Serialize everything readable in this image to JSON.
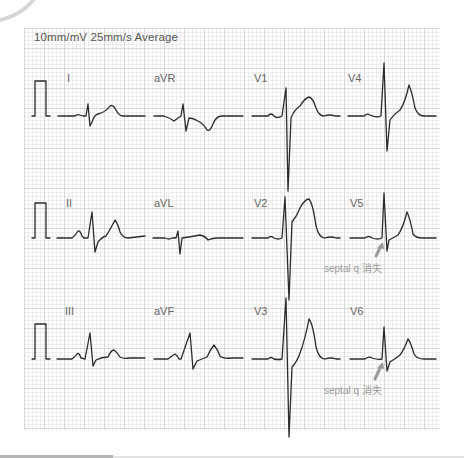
{
  "header": {
    "settings": "10mm/mV 25mm/s Average"
  },
  "leads": [
    {
      "id": "I",
      "label": "I"
    },
    {
      "id": "aVR",
      "label": "aVR"
    },
    {
      "id": "V1",
      "label": "V1"
    },
    {
      "id": "V4",
      "label": "V4"
    },
    {
      "id": "II",
      "label": "II"
    },
    {
      "id": "aVL",
      "label": "aVL"
    },
    {
      "id": "V2",
      "label": "V2"
    },
    {
      "id": "V5",
      "label": "V5"
    },
    {
      "id": "III",
      "label": "III"
    },
    {
      "id": "aVF",
      "label": "aVF"
    },
    {
      "id": "V3",
      "label": "V3"
    },
    {
      "id": "V6",
      "label": "V6"
    }
  ],
  "annotations": [
    {
      "lead": "V5",
      "text": "septal q 消失"
    },
    {
      "lead": "V6",
      "text": "septal q 消失"
    }
  ],
  "colors": {
    "trace": "#2b2b2b",
    "arrow": "#9a9a9a",
    "grid_major": "#c8c8c8",
    "grid_minor": "#e1e1e1"
  }
}
